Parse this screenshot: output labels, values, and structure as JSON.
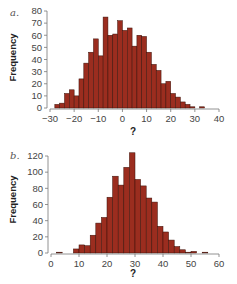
{
  "chart_data": [
    {
      "type": "bar",
      "panel_label": "a.",
      "title": "",
      "xlabel": "?",
      "ylabel": "Frequency",
      "xlim": [
        -30,
        40
      ],
      "ylim": [
        0,
        80
      ],
      "xticks": [
        -30,
        -20,
        -10,
        0,
        10,
        20,
        30,
        40
      ],
      "yticks": [
        0,
        10,
        20,
        30,
        40,
        50,
        60,
        70,
        80
      ],
      "bin_width": 2,
      "bin_starts": [
        -28,
        -26,
        -24,
        -22,
        -20,
        -18,
        -16,
        -14,
        -12,
        -10,
        -8,
        -6,
        -4,
        -2,
        0,
        2,
        4,
        6,
        8,
        10,
        12,
        14,
        16,
        18,
        20,
        22,
        24,
        26,
        28,
        30,
        32
      ],
      "values": [
        3,
        4,
        12,
        15,
        10,
        24,
        37,
        46,
        57,
        43,
        75,
        60,
        61,
        72,
        64,
        66,
        51,
        60,
        59,
        46,
        36,
        31,
        20,
        22,
        12,
        9,
        5,
        3,
        1,
        0,
        1
      ],
      "grid": false,
      "legend": null,
      "bar_color": "#9b2d1f",
      "bar_edge_color": "#3a1008"
    },
    {
      "type": "bar",
      "panel_label": "b.",
      "title": "",
      "xlabel": "?",
      "ylabel": "Frequency",
      "xlim": [
        0,
        60
      ],
      "ylim": [
        0,
        120
      ],
      "xticks": [
        0,
        10,
        20,
        30,
        40,
        50,
        60
      ],
      "yticks": [
        0,
        20,
        40,
        60,
        80,
        100,
        120
      ],
      "bin_width": 2,
      "bin_starts": [
        2,
        4,
        6,
        8,
        10,
        12,
        14,
        16,
        18,
        20,
        22,
        24,
        26,
        28,
        30,
        32,
        34,
        36,
        38,
        40,
        42,
        44,
        46,
        48,
        50,
        52,
        54
      ],
      "values": [
        1,
        0,
        0,
        5,
        10,
        9,
        22,
        37,
        44,
        69,
        95,
        84,
        106,
        124,
        91,
        83,
        68,
        63,
        33,
        26,
        16,
        8,
        4,
        1,
        2,
        0,
        1
      ],
      "grid": false,
      "legend": null,
      "bar_color": "#9b2d1f",
      "bar_edge_color": "#3a1008"
    }
  ],
  "colors": {
    "bar": "#9b2d1f",
    "bar_edge": "#3a1008",
    "axis": "#777777"
  }
}
